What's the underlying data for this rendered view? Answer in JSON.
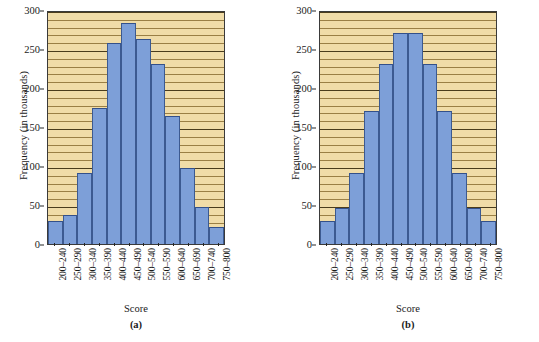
{
  "figure": {
    "background_color": "#ffffff",
    "plot_background_color": "#f0dca8",
    "bar_color": "#7d9fd8",
    "bar_border_color": "#3c5a91",
    "axis_color": "#3a3a3a"
  },
  "chart_data": [
    {
      "type": "bar",
      "panel": "a",
      "caption": "(a)",
      "title": "",
      "xlabel": "Score",
      "ylabel": "Frequency (in thousands)",
      "categories": [
        "200–240",
        "250–290",
        "300–340",
        "350–390",
        "400–440",
        "450–490",
        "500–540",
        "550–590",
        "600–640",
        "650–690",
        "700–740",
        "750–800"
      ],
      "values": [
        30,
        37,
        91,
        175,
        258,
        283,
        263,
        231,
        164,
        97,
        47,
        22
      ],
      "ylim": [
        0,
        300
      ],
      "yticks": [
        0,
        50,
        100,
        150,
        200,
        250,
        300
      ],
      "ytick_labels": [
        "0",
        "50",
        "100",
        "150",
        "200",
        "250",
        "300"
      ],
      "grid": true,
      "grid_minor_step": 10,
      "legend": null
    },
    {
      "type": "bar",
      "panel": "b",
      "caption": "(b)",
      "title": "",
      "xlabel": "Score",
      "ylabel": "Frequency (in thousands)",
      "categories": [
        "200–240",
        "250–290",
        "300–340",
        "350–390",
        "400–440",
        "450–490",
        "500–540",
        "550–590",
        "600–640",
        "650–690",
        "700–740",
        "750–800"
      ],
      "values": [
        30,
        46,
        91,
        170,
        231,
        270,
        270,
        231,
        170,
        91,
        46,
        30
      ],
      "ylim": [
        0,
        300
      ],
      "yticks": [
        0,
        50,
        100,
        150,
        200,
        250,
        300
      ],
      "ytick_labels": [
        "0",
        "50",
        "100",
        "150",
        "200",
        "250",
        "300"
      ],
      "grid": true,
      "grid_minor_step": 10,
      "legend": null
    }
  ]
}
